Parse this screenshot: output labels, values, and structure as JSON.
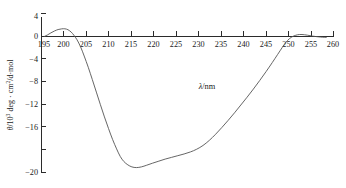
{
  "figure": {
    "background_color": "#ffffff",
    "curve_color": "#555555",
    "axis_color": "#2b2b2b"
  },
  "axes": {
    "x": {
      "label": "λ/nm",
      "label_symbol": "λ",
      "label_unit": "/nm",
      "min": 195,
      "max": 260,
      "tick_step": 5,
      "ticks": [
        "195",
        "200",
        "205",
        "210",
        "215",
        "220",
        "225",
        "230",
        "235",
        "240",
        "245",
        "250",
        "255",
        "260"
      ],
      "tick_values": [
        195,
        200,
        205,
        210,
        215,
        220,
        225,
        230,
        235,
        240,
        245,
        250,
        255,
        260
      ]
    },
    "y": {
      "label": "θ/10³ deg · cm²/d·mol",
      "label_parts": {
        "symbol": "θ",
        "scale_base": "/10",
        "scale_exp": "3",
        "units_a": " deg · cm",
        "units_exp": "2",
        "units_b": "/d·mol"
      },
      "min": -20,
      "max": 4,
      "tick_step": 4,
      "ticks": [
        "4",
        "0",
        "−4",
        "−8",
        "−12",
        "−16",
        "−20"
      ],
      "tick_values": [
        4,
        0,
        -4,
        -8,
        -12,
        -16,
        -20
      ]
    }
  },
  "annotations": [
    {
      "text": "λ/nm",
      "x": 232,
      "y": -7.8
    }
  ],
  "chart_data": {
    "type": "line",
    "title": "",
    "subtitle": "",
    "xlabel": "λ/nm",
    "ylabel": "θ/10³ deg · cm²/d·mol",
    "xlim": [
      195,
      260
    ],
    "ylim": [
      -20,
      4
    ],
    "grid": false,
    "legend": null,
    "series": [
      {
        "name": "CD spectrum",
        "color": "#555555",
        "x": [
          195.8,
          196.5,
          197.2,
          198.0,
          198.8,
          199.6,
          200.3,
          201.0,
          201.7,
          202.3,
          203.0,
          203.8,
          204.6,
          205.5,
          206.4,
          207.3,
          208.2,
          209.1,
          210.0,
          210.9,
          211.8,
          212.6,
          213.4,
          214.3,
          215.2,
          216.2,
          217.3,
          218.5,
          219.8,
          221.2,
          222.6,
          224.0,
          225.4,
          226.8,
          228.2,
          229.6,
          231.0,
          232.4,
          233.8,
          235.2,
          236.6,
          238.0,
          239.4,
          240.8,
          242.2,
          243.6,
          245.0,
          246.4,
          247.6,
          248.6,
          249.4,
          250.2,
          251.0,
          252.0,
          253.0,
          254.2,
          255.4,
          256.6,
          257.6,
          258.4
        ],
        "y": [
          -0.05,
          0.18,
          0.46,
          0.74,
          0.95,
          1.05,
          1.06,
          0.92,
          0.58,
          0.12,
          -0.55,
          -1.6,
          -2.95,
          -4.6,
          -6.4,
          -8.25,
          -10.1,
          -11.9,
          -13.6,
          -15.2,
          -16.6,
          -17.7,
          -18.45,
          -18.95,
          -19.25,
          -19.35,
          -19.25,
          -19.0,
          -18.7,
          -18.4,
          -18.1,
          -17.85,
          -17.6,
          -17.35,
          -17.05,
          -16.65,
          -16.1,
          -15.35,
          -14.45,
          -13.45,
          -12.4,
          -11.3,
          -10.15,
          -9.0,
          -7.8,
          -6.55,
          -5.25,
          -3.9,
          -2.7,
          -1.7,
          -0.95,
          -0.4,
          -0.05,
          0.18,
          0.22,
          0.12,
          -0.02,
          -0.12,
          -0.18,
          -0.2
        ]
      }
    ],
    "features": {
      "positive_peak": {
        "x": 200.3,
        "y": 1.06
      },
      "zero_crossing_descending": 202.5,
      "negative_minimum": {
        "x": 216.2,
        "y": -19.35
      },
      "shoulder": {
        "x": 222.0,
        "y": -18.2
      },
      "zero_crossing_ascending": 251.0
    }
  }
}
